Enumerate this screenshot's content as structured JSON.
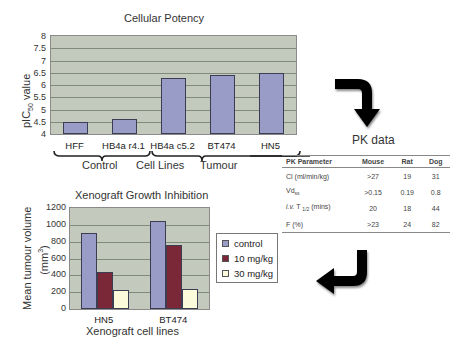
{
  "potency": {
    "title": "Cellular Potency",
    "ylabel_main": "pIC",
    "ylabel_sub": "50",
    "ylabel_rest": " value",
    "yticks": [
      "8",
      "7.5",
      "7",
      "6.5",
      "6",
      "5.5",
      "5",
      "4.5",
      "4"
    ],
    "categories": [
      "HFF",
      "HB4a r4.1",
      "HB4a c5.2",
      "BT474",
      "HN5"
    ],
    "groups": [
      "Control",
      "Cell Lines",
      "Tumour"
    ]
  },
  "arrows": {
    "top": "curved-arrow-down",
    "bottom": "curved-arrow-left"
  },
  "pk": {
    "title": "PK data",
    "headers": [
      "PK Parameter",
      "Mouse",
      "Rat",
      "Dog"
    ],
    "rows": [
      {
        "param": "Cl (ml/min/kg)",
        "mouse": ">27",
        "rat": "19",
        "dog": "31"
      },
      {
        "param_main": "Vd",
        "param_sub": "ss",
        "mouse": ">0.15",
        "rat": "0.19",
        "dog": "0.8"
      },
      {
        "param_italic": "i.v.",
        "param_main": " T ",
        "param_sub": "1/2",
        "param_rest": " (mins)",
        "mouse": "20",
        "rat": "18",
        "dog": "44"
      },
      {
        "param": "F (%)",
        "mouse": ">23",
        "rat": "24",
        "dog": "82"
      }
    ]
  },
  "xeno": {
    "title": "Xenograft Growth Inhibition",
    "ylabel_line1": "Mean tumour volume",
    "ylabel_line2_pre": "(mm",
    "ylabel_line2_sup": "3",
    "ylabel_line2_post": ")",
    "yticks": [
      "1200",
      "1000",
      "800",
      "600",
      "400",
      "200",
      "0"
    ],
    "categories": [
      "HN5",
      "BT474"
    ],
    "xlabel": "Xenograft cell lines",
    "legend": [
      "control",
      "10 mg/kg",
      "30 mg/kg"
    ]
  },
  "colors": {
    "plot_bg": "#c4c9be",
    "bar_potency": "#9a9cc8",
    "control": "#9a9cc8",
    "dose10": "#7a2838",
    "dose30": "#fbfbdc"
  },
  "chart_data": [
    {
      "type": "bar",
      "title": "Cellular Potency",
      "xlabel": "",
      "ylabel": "pIC50 value",
      "categories": [
        "HFF",
        "HB4a r4.1",
        "HB4a c5.2",
        "BT474",
        "HN5"
      ],
      "values": [
        4.5,
        4.6,
        6.3,
        6.4,
        6.5
      ],
      "ylim": [
        4,
        8
      ],
      "yticks": [
        4,
        4.5,
        5,
        5.5,
        6,
        6.5,
        7,
        7.5,
        8
      ],
      "grid": true,
      "annotations": [
        "Control (HFF, HB4a r4.1)",
        "Cell Lines (HB4a c5.2)",
        "Tumour (BT474, HN5)"
      ]
    },
    {
      "type": "table",
      "title": "PK data",
      "columns": [
        "PK Parameter",
        "Mouse",
        "Rat",
        "Dog"
      ],
      "rows": [
        [
          "Cl (ml/min/kg)",
          ">27",
          "19",
          "31"
        ],
        [
          "Vd_ss",
          ">0.15",
          "0.19",
          "0.8"
        ],
        [
          "i.v. T_1/2 (mins)",
          "20",
          "18",
          "44"
        ],
        [
          "F (%)",
          ">23",
          "24",
          "82"
        ]
      ]
    },
    {
      "type": "bar",
      "title": "Xenograft Growth Inhibition",
      "xlabel": "Xenograft cell lines",
      "ylabel": "Mean tumour volume (mm3)",
      "categories": [
        "HN5",
        "BT474"
      ],
      "series": [
        {
          "name": "control",
          "values": [
            900,
            1040
          ]
        },
        {
          "name": "10 mg/kg",
          "values": [
            440,
            760
          ]
        },
        {
          "name": "30 mg/kg",
          "values": [
            230,
            240
          ]
        }
      ],
      "ylim": [
        0,
        1200
      ],
      "yticks": [
        0,
        200,
        400,
        600,
        800,
        1000,
        1200
      ],
      "grid": true,
      "legend_position": "right"
    }
  ]
}
